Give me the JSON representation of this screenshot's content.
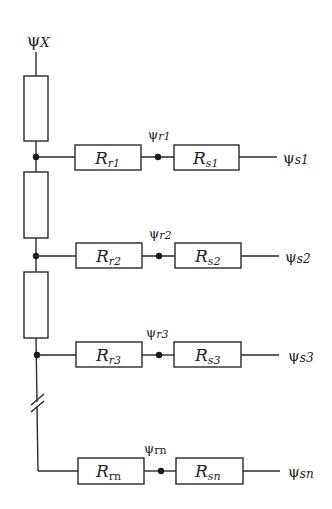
{
  "diagram": {
    "type": "resistor network (flux-linkage equivalent circuit)",
    "top_node": {
      "symbol": "ψ",
      "subscript": "X"
    },
    "branches": [
      {
        "id": "1",
        "rotor": {
          "R": "R",
          "sub": "r1"
        },
        "mid": {
          "symbol": "ψ",
          "sub": "r1"
        },
        "stator": {
          "R": "R",
          "sub": "s1"
        },
        "out": {
          "symbol": "ψ",
          "sub": "s1"
        }
      },
      {
        "id": "2",
        "rotor": {
          "R": "R",
          "sub": "r2"
        },
        "mid": {
          "symbol": "ψ",
          "sub": "r2"
        },
        "stator": {
          "R": "R",
          "sub": "s2"
        },
        "out": {
          "symbol": "ψ",
          "sub": "s2"
        }
      },
      {
        "id": "3",
        "rotor": {
          "R": "R",
          "sub": "r3"
        },
        "mid": {
          "symbol": "ψ",
          "sub": "r3"
        },
        "stator": {
          "R": "R",
          "sub": "s3"
        },
        "out": {
          "symbol": "ψ",
          "sub": "s3"
        }
      },
      {
        "id": "n",
        "rotor": {
          "R": "R",
          "sub": "rn"
        },
        "mid": {
          "symbol": "ψ",
          "sub": "rn"
        },
        "stator": {
          "R": "R",
          "sub": "sn"
        },
        "out": {
          "symbol": "ψ",
          "sub": "sn"
        }
      }
    ],
    "series_resistor_count": 3,
    "break_marker": "//"
  }
}
